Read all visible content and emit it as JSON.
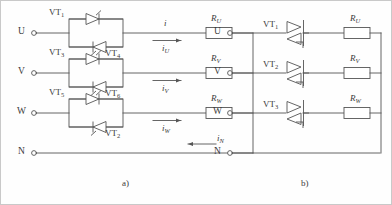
{
  "figure": {
    "type": "circuit-diagram",
    "line_color": "#555555",
    "text_color": "#3b3b3b",
    "background": "#fefefe"
  },
  "panels": [
    {
      "id": "a",
      "caption": "a)",
      "device_type": "antiparallel-thyristor-pair",
      "terminals": [
        "U",
        "V",
        "W",
        "N"
      ],
      "rows": [
        {
          "terminal": "U",
          "device_top": {
            "base": "VT",
            "sub": "1"
          },
          "device_bottom": {
            "base": "VT",
            "sub": "4"
          },
          "resistor": {
            "base": "R",
            "sub": "U"
          },
          "current": {
            "base": "i",
            "sub": "U"
          },
          "current_extra": {
            "base": "i",
            "sub": ""
          },
          "arrow_dir": "right"
        },
        {
          "terminal": "V",
          "device_top": {
            "base": "VT",
            "sub": "3"
          },
          "device_bottom": {
            "base": "VT",
            "sub": "6"
          },
          "resistor": {
            "base": "R",
            "sub": "V"
          },
          "current": {
            "base": "i",
            "sub": "V"
          },
          "arrow_dir": "right"
        },
        {
          "terminal": "W",
          "device_top": {
            "base": "VT",
            "sub": "5"
          },
          "device_bottom": {
            "base": "VT",
            "sub": "2"
          },
          "resistor": {
            "base": "R",
            "sub": "W"
          },
          "current": {
            "base": "i",
            "sub": "W"
          },
          "arrow_dir": "right"
        }
      ],
      "neutral": {
        "terminal": "N",
        "current": {
          "base": "i",
          "sub": "N"
        },
        "arrow_dir": "left"
      }
    },
    {
      "id": "b",
      "caption": "b)",
      "device_type": "triac",
      "terminals": [
        "U",
        "V",
        "W",
        "N"
      ],
      "rows": [
        {
          "terminal": "U",
          "device": {
            "base": "VT",
            "sub": "1"
          },
          "resistor": {
            "base": "R",
            "sub": "U"
          }
        },
        {
          "terminal": "V",
          "device": {
            "base": "VT",
            "sub": "2"
          },
          "resistor": {
            "base": "R",
            "sub": "V"
          }
        },
        {
          "terminal": "W",
          "device": {
            "base": "VT",
            "sub": "3"
          },
          "resistor": {
            "base": "R",
            "sub": "W"
          }
        }
      ],
      "neutral": {
        "terminal": "N"
      }
    }
  ]
}
